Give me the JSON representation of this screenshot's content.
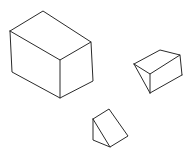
{
  "figure": {
    "stroke_color": "#2a2a2a",
    "background": "#ffffff",
    "shapes": [
      {
        "name": "rectangular-box",
        "label": ""
      },
      {
        "name": "wedge-prism",
        "label": ""
      },
      {
        "name": "triangular-prism",
        "label": ""
      }
    ]
  }
}
